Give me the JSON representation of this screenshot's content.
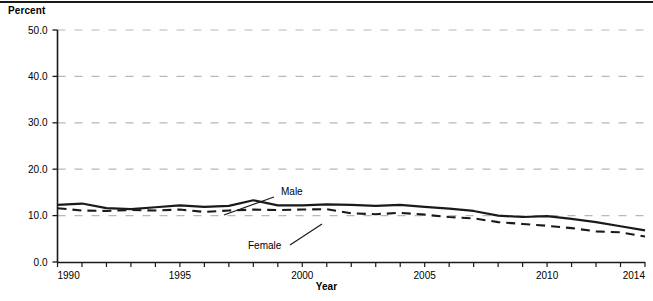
{
  "figure": {
    "y_axis_title": "Percent",
    "x_axis_title": "Year"
  },
  "chart_data": {
    "type": "line",
    "title": "",
    "xlabel": "Year",
    "ylabel": "Percent",
    "xlim": [
      1990,
      2014
    ],
    "ylim": [
      0.0,
      50.0
    ],
    "grid": true,
    "grid_axis": "y",
    "legend_position": "inline-annotations",
    "x": [
      1990,
      1991,
      1992,
      1993,
      1994,
      1995,
      1996,
      1997,
      1998,
      1999,
      2000,
      2001,
      2002,
      2003,
      2004,
      2005,
      2006,
      2007,
      2008,
      2009,
      2010,
      2011,
      2012,
      2013,
      2014
    ],
    "xticks": [
      1990,
      1995,
      2000,
      2005,
      2010,
      2014
    ],
    "xtick_labels": [
      "1990",
      "1995",
      "2000",
      "2005",
      "2010",
      "2014"
    ],
    "yticks": [
      0.0,
      10.0,
      20.0,
      30.0,
      40.0,
      50.0
    ],
    "ytick_labels": [
      "0.0",
      "10.0",
      "20.0",
      "30.0",
      "40.0",
      "50.0"
    ],
    "series": [
      {
        "name": "Male",
        "style": "solid",
        "color": "#1a1a1a",
        "label_text": "Male",
        "values": [
          12.3,
          12.6,
          11.6,
          11.4,
          11.8,
          12.2,
          11.9,
          12.1,
          13.3,
          12.2,
          12.2,
          12.4,
          12.3,
          12.1,
          12.3,
          11.9,
          11.5,
          11.0,
          10.0,
          9.7,
          9.9,
          9.3,
          8.6,
          7.7,
          6.8
        ]
      },
      {
        "name": "Female",
        "style": "dashed",
        "color": "#1a1a1a",
        "label_text": "Female",
        "values": [
          11.6,
          11.1,
          11.0,
          11.2,
          11.1,
          11.3,
          10.8,
          11.1,
          11.3,
          11.2,
          11.3,
          11.4,
          10.5,
          10.3,
          10.6,
          10.2,
          9.7,
          9.4,
          8.6,
          8.2,
          7.8,
          7.3,
          6.6,
          6.4,
          5.5
        ]
      }
    ],
    "annotations": [
      {
        "text": "Male",
        "x_px": 281,
        "y_px": 195
      },
      {
        "text": "Female",
        "x_px": 248,
        "y_px": 249
      }
    ]
  }
}
